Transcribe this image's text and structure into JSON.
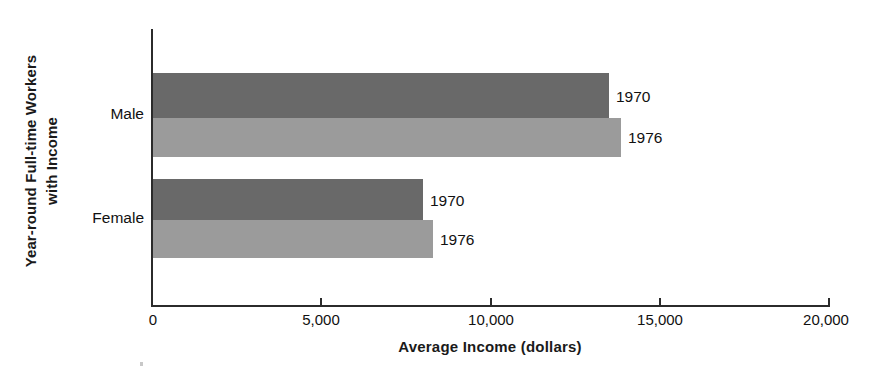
{
  "chart_data": {
    "type": "bar",
    "orientation": "horizontal",
    "title": "",
    "xlabel": "Average Income (dollars)",
    "ylabel": "Year-round Full-time Workers\nwith Income",
    "categories": [
      "Male",
      "Female"
    ],
    "series": [
      {
        "name": "1970",
        "color": "#696969",
        "values": [
          13460,
          7970
        ]
      },
      {
        "name": "1976",
        "color": "#9b9b9b",
        "values": [
          13820,
          8270
        ]
      }
    ],
    "bars": [
      {
        "category": "Male",
        "series": "1970",
        "value": 13460,
        "label": "1970",
        "color": "#696969"
      },
      {
        "category": "Male",
        "series": "1976",
        "value": 13820,
        "label": "1976",
        "color": "#9b9b9b"
      },
      {
        "category": "Female",
        "series": "1970",
        "value": 7970,
        "label": "1970",
        "color": "#696969"
      },
      {
        "category": "Female",
        "series": "1976",
        "value": 8270,
        "label": "1976",
        "color": "#9b9b9b"
      }
    ],
    "xlim": [
      0,
      20000
    ],
    "xticks": [
      0,
      5000,
      10000,
      15000,
      20000
    ],
    "xticklabels": [
      "0",
      "5,000",
      "10,000",
      "15,000",
      "20,000"
    ],
    "grid": false,
    "legend": "inline-bar-labels",
    "background": "#ffffff",
    "axis_color": "#2b2b2b"
  },
  "axes": {
    "x_title": "Average Income (dollars)",
    "y_title": "Year-round Full-time Workers\nwith Income",
    "tick_labels": {
      "t0": "0",
      "t1": "5,000",
      "t2": "10,000",
      "t3": "15,000",
      "t4": "20,000"
    }
  },
  "categories": {
    "male": "Male",
    "female": "Female"
  },
  "bar_labels": {
    "male_1970": "1970",
    "male_1976": "1976",
    "female_1970": "1970",
    "female_1976": "1976"
  }
}
